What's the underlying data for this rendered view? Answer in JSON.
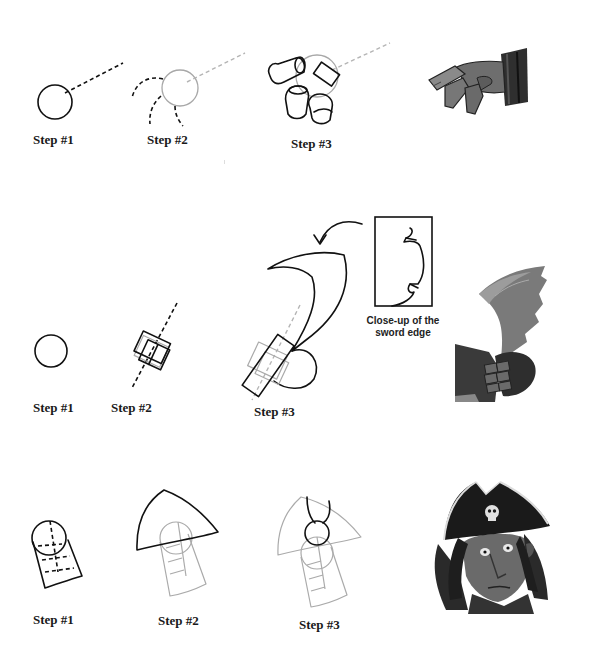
{
  "rows": [
    {
      "subject": "hand",
      "steps": [
        {
          "label": "Step #1"
        },
        {
          "label": "Step #2"
        },
        {
          "label": "Step #3"
        }
      ],
      "final_art": "pirate-hand-illustration"
    },
    {
      "subject": "sword",
      "steps": [
        {
          "label": "Step #1"
        },
        {
          "label": "Step #2"
        },
        {
          "label": "Step #3"
        }
      ],
      "inset": {
        "caption_line1": "Close-up of the",
        "caption_line2": "sword edge"
      },
      "final_art": "pirate-sword-illustration"
    },
    {
      "subject": "pirate-head",
      "steps": [
        {
          "label": "Step #1"
        },
        {
          "label": "Step #2"
        },
        {
          "label": "Step #3"
        }
      ],
      "final_art": "pirate-head-illustration"
    }
  ],
  "colors": {
    "ink": "#111111",
    "ghost_line": "#aaaaaa",
    "art_dark": "#2a2a2a",
    "art_mid": "#6b6b6b",
    "art_light": "#9a9a9a"
  }
}
